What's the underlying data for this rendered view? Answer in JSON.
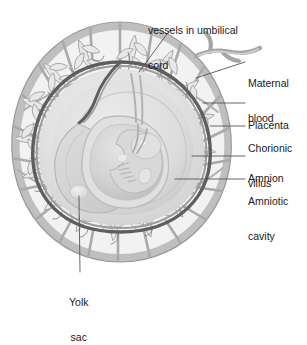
{
  "figure": {
    "type": "anatomical-cross-section",
    "background_color": "#ffffff",
    "ink_color": "#1a1a1a"
  },
  "palette": {
    "decidua_gray": "#a8a8a8",
    "decidua_light": "#c9c9c9",
    "villus_gray": "#b4b4b4",
    "villus_pale": "#dcdcdc",
    "chorion_dark": "#5a5a5a",
    "amnion_band": "#8f8f8f",
    "amniotic_fluid": "#dedede",
    "amniotic_fluid_light": "#e9e9e9",
    "embryo_gray": "#cfcfcf",
    "embryo_light": "#dddddd",
    "yolk_sac": "#e6e6e6",
    "leader_line": "#555555",
    "cavity_inner": "#d4d4d4"
  },
  "labels": [
    {
      "id": "vessels-umbilical-cord",
      "text_lines": [
        "vessels in umbilical",
        "cord"
      ],
      "x": 148,
      "y": 3,
      "align": "left",
      "leader": {
        "x1": 170,
        "y1": 30,
        "x2": 139,
        "y2": 72
      }
    },
    {
      "id": "maternal-blood",
      "text_lines": [
        "Maternal",
        "blood"
      ],
      "x": 248,
      "y": 56,
      "align": "left",
      "leader": {
        "x1": 245,
        "y1": 62,
        "x2": 196,
        "y2": 78
      }
    },
    {
      "id": "placenta",
      "text_lines": [
        "Placenta"
      ],
      "x": 248,
      "y": 98,
      "align": "left",
      "leader": {
        "x1": 245,
        "y1": 103,
        "x2": 203,
        "y2": 103
      }
    },
    {
      "id": "chorionic-villus",
      "text_lines": [
        "Chorionic",
        "villus"
      ],
      "x": 248,
      "y": 121,
      "align": "left",
      "leader": {
        "x1": 245,
        "y1": 126,
        "x2": 210,
        "y2": 126
      }
    },
    {
      "id": "amnion",
      "text_lines": [
        "Amnion"
      ],
      "x": 248,
      "y": 151,
      "align": "left",
      "leader": {
        "x1": 245,
        "y1": 156,
        "x2": 192,
        "y2": 156
      }
    },
    {
      "id": "amniotic-cavity",
      "text_lines": [
        "Amniotic",
        "cavity"
      ],
      "x": 248,
      "y": 174,
      "align": "left",
      "leader": {
        "x1": 245,
        "y1": 179,
        "x2": 175,
        "y2": 179
      }
    },
    {
      "id": "yolk-sac",
      "text_lines": [
        "Yolk",
        "sac"
      ],
      "x": 69,
      "y": 276,
      "align": "left",
      "leader": {
        "x1": 80,
        "y1": 272,
        "x2": 79,
        "y2": 196
      }
    }
  ],
  "structures": [
    {
      "id": "decidua-outer-wall",
      "name": "decidua basalis and capsularis outer wall"
    },
    {
      "id": "decidual-septa",
      "name": "radial decidual septa compartments"
    },
    {
      "id": "chorionic-villi",
      "name": "branching chorionic villi in intervillous space"
    },
    {
      "id": "maternal-vessel",
      "name": "maternal spiral artery entering at upper right"
    },
    {
      "id": "chorion-amnion-membrane",
      "name": "dark chorion and amnion membrane boundary"
    },
    {
      "id": "amniotic-cavity-fluid",
      "name": "amniotic cavity filled with fluid"
    },
    {
      "id": "embryo",
      "name": "curled embryo with head, limb buds and somites"
    },
    {
      "id": "yolk-sac-vesicle",
      "name": "yolk sac vesicle"
    },
    {
      "id": "umbilical-cord",
      "name": "umbilical cord with vessels"
    }
  ]
}
